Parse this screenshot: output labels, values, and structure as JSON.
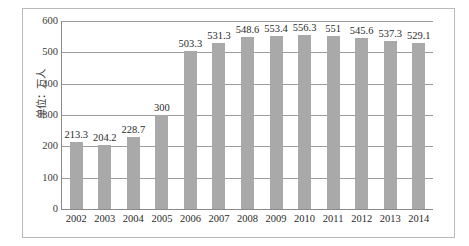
{
  "chart_data": {
    "type": "bar",
    "title": "",
    "subtitle": "",
    "xlabel": "",
    "ylabel": "单位：万人",
    "categories": [
      "2002",
      "2003",
      "2004",
      "2005",
      "2006",
      "2007",
      "2008",
      "2009",
      "2010",
      "2011",
      "2012",
      "2013",
      "2014"
    ],
    "values": [
      213.3,
      204.2,
      228.7,
      300,
      503.3,
      531.3,
      548.6,
      553.4,
      556.3,
      551,
      545.6,
      537.3,
      529.1
    ],
    "data_labels": [
      "213.3",
      "204.2",
      "228.7",
      "300",
      "503.3",
      "531.3",
      "548.6",
      "553.4",
      "556.3",
      "551",
      "545.6",
      "537.3",
      "529.1"
    ],
    "ylim": [
      0,
      600
    ],
    "yticks": [
      0,
      100,
      200,
      300,
      400,
      500,
      600
    ],
    "ytick_labels": [
      "0",
      "100",
      "200",
      "300",
      "400",
      "500",
      "600"
    ],
    "grid": "horizontal",
    "legend": "none",
    "series_name": "",
    "bar_color": "#a9a9a9",
    "gridline_color": "#9c9c9c",
    "axis_color": "#8a8a8a",
    "frame_color": "#b9b9b9",
    "background_color": "#ffffff",
    "label_color": "#2b2b2b"
  }
}
